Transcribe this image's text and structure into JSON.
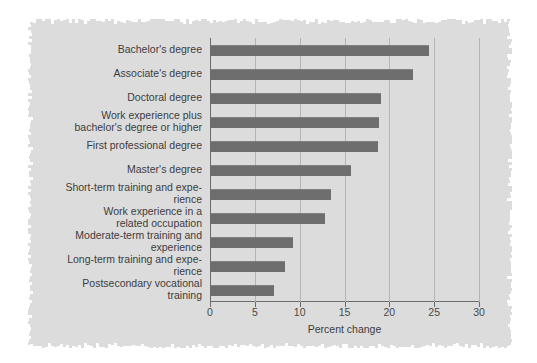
{
  "figure": {
    "background_color": "#dcdcdc",
    "page_color": "#ffffff",
    "bar_color": "#6e6e6e",
    "gridline_color": "#b4b4b4",
    "axis_color": "#6b6b6b"
  },
  "chart_data": {
    "type": "bar",
    "orientation": "horizontal",
    "title": "",
    "subtitle": "",
    "xlabel": "Percent change",
    "ylabel": "",
    "xlim": [
      0,
      30
    ],
    "xticks": [
      0,
      5,
      10,
      15,
      20,
      25,
      30
    ],
    "xticklabels": [
      "0",
      "5",
      "10",
      "15",
      "20",
      "25",
      "30"
    ],
    "grid": "vertical",
    "legend": "none",
    "categories": [
      "Bachelor's degree",
      "Associate's degree",
      "Doctoral degree",
      "Work experience plus bachelor's degree or higher",
      "First professional degree",
      "Master's degree",
      "Short-term training and expe-rience",
      "Work experience in a related occupation",
      "Moderate-term training and experience",
      "Long-term training and expe-rience",
      "Postsecondary vocational training"
    ],
    "category_lines": [
      [
        "Bachelor's degree"
      ],
      [
        "Associate's degree"
      ],
      [
        "Doctoral degree"
      ],
      [
        "Work experience plus",
        "bachelor's degree or higher"
      ],
      [
        "First professional degree"
      ],
      [
        "Master's degree"
      ],
      [
        "Short-term training and expe-",
        "rience"
      ],
      [
        "Work experience in a",
        "related occupation"
      ],
      [
        "Moderate-term training and",
        "experience"
      ],
      [
        "Long-term training and expe-",
        "rience"
      ],
      [
        "Postsecondary vocational",
        "training"
      ]
    ],
    "values": [
      24.3,
      22.5,
      19.0,
      18.7,
      18.6,
      15.6,
      13.4,
      12.7,
      9.1,
      8.3,
      7.0
    ]
  }
}
